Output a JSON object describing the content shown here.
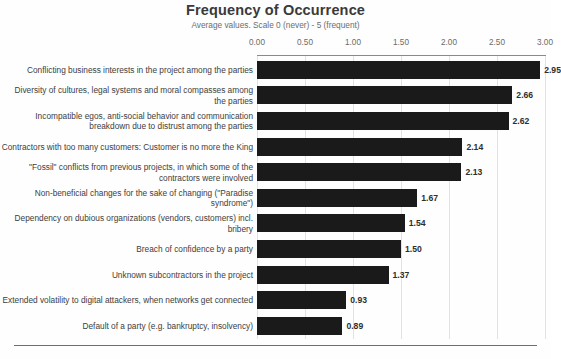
{
  "chart_data": {
    "type": "bar",
    "orientation": "horizontal",
    "title": "Frequency of Occurrence",
    "subtitle": "Average values. Scale 0 (never) - 5 (frequent)",
    "xlabel": "",
    "ylabel": "",
    "xlim": [
      0,
      3.0
    ],
    "xticks": [
      "0.00",
      "0.50",
      "1.00",
      "1.50",
      "2.00",
      "2.50",
      "3.00"
    ],
    "xtick_values": [
      0,
      0.5,
      1.0,
      1.5,
      2.0,
      2.5,
      3.0
    ],
    "grid": true,
    "legend": "none",
    "bar_color": "#1a1a1a",
    "categories": [
      "Conflicting business interests in the project among the parties",
      "Diversity of cultures, legal systems and moral compasses among the parties",
      "Incompatible egos, anti-social behavior and communication breakdown due to distrust among the parties",
      "Contractors with too many customers: Customer is no more the King",
      "\"Fossil\" conflicts from previous projects, in which some of the contractors were involved",
      "Non-beneficial changes for the sake of changing (\"Paradise syndrome\")",
      "Dependency on dubious organizations (vendors, customers) incl. bribery",
      "Breach of confidence by a party",
      "Unknown subcontractors in the project",
      "Extended volatility to digital attackers, when networks get connected",
      "Default of a party (e.g. bankruptcy, insolvency)"
    ],
    "values": [
      2.95,
      2.66,
      2.62,
      2.14,
      2.13,
      1.67,
      1.54,
      1.5,
      1.37,
      0.93,
      0.89
    ],
    "value_labels": [
      "2.95",
      "2.66",
      "2.62",
      "2.14",
      "2.13",
      "1.67",
      "1.54",
      "1.50",
      "1.37",
      "0.93",
      "0.89"
    ]
  }
}
